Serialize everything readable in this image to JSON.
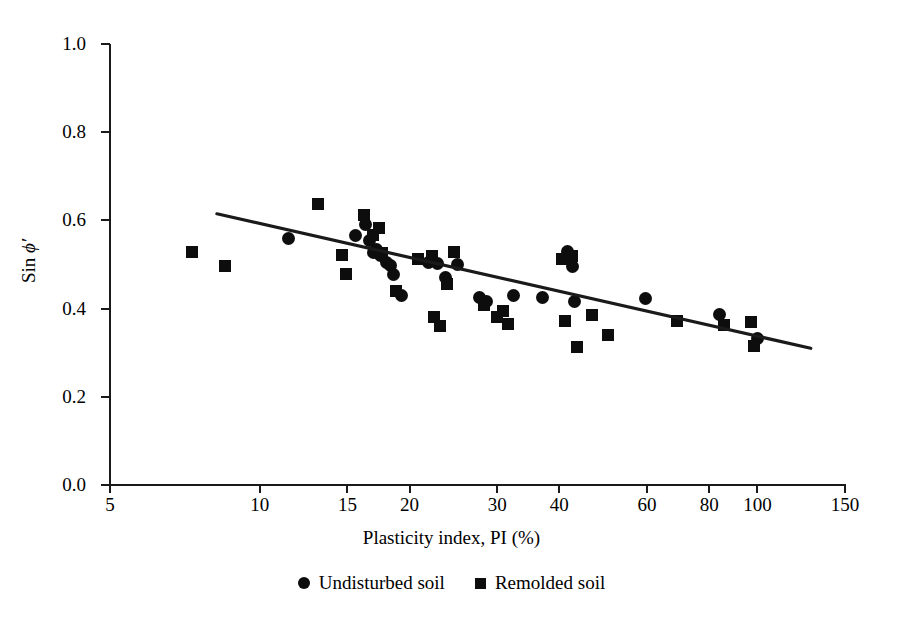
{
  "chart_data": {
    "type": "scatter",
    "title": "",
    "xlabel": "Plasticity index, PI (%)",
    "ylabel": "Sin ϕ′",
    "ylabel_prefix": "Sin ",
    "ylabel_symbol": "ϕ′",
    "xscale": "log",
    "yscale": "linear",
    "xlim": [
      5,
      150
    ],
    "ylim": [
      0.0,
      1.0
    ],
    "grid": false,
    "legend_position": "bottom-center",
    "xticks": [
      5,
      10,
      15,
      20,
      30,
      40,
      60,
      80,
      100,
      150
    ],
    "xtick_labels": [
      "5",
      "10",
      "15",
      "20",
      "30",
      "40",
      "60",
      "80",
      "100",
      "150"
    ],
    "yticks": [
      0.0,
      0.2,
      0.4,
      0.6,
      0.8,
      1.0
    ],
    "ytick_labels": [
      "0.0",
      "0.2",
      "0.4",
      "0.6",
      "0.8",
      "1.0"
    ],
    "marker_color": "#0d0d0d",
    "line_color": "#1a1a1a",
    "series": [
      {
        "name": "Undisturbed soil",
        "marker": "circle",
        "points": [
          [
            11.4,
            0.558
          ],
          [
            15.6,
            0.565
          ],
          [
            16.3,
            0.59
          ],
          [
            16.6,
            0.555
          ],
          [
            16.9,
            0.528
          ],
          [
            17.2,
            0.535
          ],
          [
            17.5,
            0.52
          ],
          [
            18.0,
            0.505
          ],
          [
            18.3,
            0.497
          ],
          [
            18.6,
            0.478
          ],
          [
            19.3,
            0.43
          ],
          [
            21.8,
            0.505
          ],
          [
            22.8,
            0.502
          ],
          [
            23.6,
            0.47
          ],
          [
            25.0,
            0.5
          ],
          [
            27.6,
            0.425
          ],
          [
            28.6,
            0.415
          ],
          [
            32.3,
            0.43
          ],
          [
            37.0,
            0.425
          ],
          [
            41.5,
            0.53
          ],
          [
            42.5,
            0.495
          ],
          [
            43.0,
            0.415
          ],
          [
            59.5,
            0.422
          ],
          [
            84.0,
            0.387
          ],
          [
            100.0,
            0.332
          ]
        ]
      },
      {
        "name": "Remolded soil",
        "marker": "square",
        "points": [
          [
            7.3,
            0.528
          ],
          [
            8.5,
            0.497
          ],
          [
            13.1,
            0.638
          ],
          [
            14.6,
            0.522
          ],
          [
            14.9,
            0.478
          ],
          [
            16.2,
            0.612
          ],
          [
            16.9,
            0.568
          ],
          [
            17.4,
            0.582
          ],
          [
            17.6,
            0.525
          ],
          [
            18.8,
            0.44
          ],
          [
            20.8,
            0.513
          ],
          [
            22.2,
            0.52
          ],
          [
            22.4,
            0.38
          ],
          [
            23.0,
            0.36
          ],
          [
            23.8,
            0.455
          ],
          [
            24.6,
            0.528
          ],
          [
            28.2,
            0.408
          ],
          [
            30.0,
            0.38
          ],
          [
            30.8,
            0.395
          ],
          [
            31.5,
            0.365
          ],
          [
            40.5,
            0.512
          ],
          [
            41.0,
            0.372
          ],
          [
            42.5,
            0.52
          ],
          [
            43.5,
            0.312
          ],
          [
            46.5,
            0.385
          ],
          [
            50.0,
            0.34
          ],
          [
            69.0,
            0.372
          ],
          [
            85.5,
            0.362
          ],
          [
            97.0,
            0.37
          ],
          [
            98.5,
            0.315
          ]
        ]
      }
    ],
    "trendline": {
      "label": "best-fit regression",
      "x_start": 8.2,
      "y_start": 0.615,
      "x_end": 128.0,
      "y_end": 0.31
    },
    "legend": [
      {
        "label": "Undisturbed soil",
        "marker": "circle"
      },
      {
        "label": "Remolded soil",
        "marker": "square"
      }
    ]
  }
}
